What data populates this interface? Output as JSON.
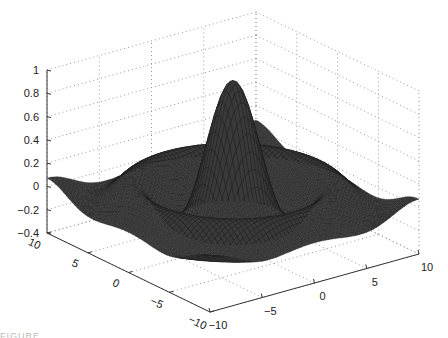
{
  "chart_data": {
    "type": "surface",
    "title": "",
    "function": "z = sin(r)/r, r = sqrt(x^2 + y^2)",
    "xlabel": "",
    "ylabel": "",
    "zlabel": "",
    "xlim": [
      -10,
      10
    ],
    "ylim": [
      -10,
      10
    ],
    "zlim": [
      -0.4,
      1
    ],
    "x_ticks": [
      -10,
      -5,
      0,
      5,
      10
    ],
    "y_ticks": [
      -10,
      -5,
      0,
      5,
      10
    ],
    "z_ticks": [
      -0.4,
      -0.2,
      0,
      0.2,
      0.4,
      0.6,
      0.8,
      1
    ],
    "x_tick_labels": [
      "-10",
      "-5",
      "0",
      "5",
      "10"
    ],
    "y_tick_labels": [
      "-10",
      "-5",
      "0",
      "5",
      "10"
    ],
    "z_tick_labels": [
      "-0.4",
      "-0.2",
      "0",
      "0.2",
      "0.4",
      "0.6",
      "0.8",
      "1"
    ],
    "grid": true,
    "grid_style": "dotted",
    "mesh_color": "#1a1a1a",
    "peak": {
      "x": 0,
      "y": 0,
      "z": 1
    },
    "grid_resolution": 61
  },
  "caption_fragment": "FIGURE"
}
